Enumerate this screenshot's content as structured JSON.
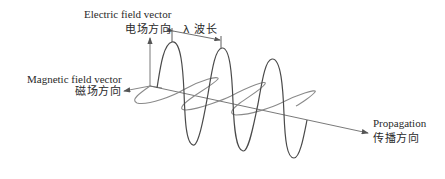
{
  "labels": {
    "electric_en": "Electric field vector",
    "electric_zh": "电场方向",
    "wavelength": "λ 波长",
    "magnetic_en": "Magnetic field vector",
    "magnetic_zh": "磁场方向",
    "propagation_en": "Propagation",
    "propagation_zh": "传播方向"
  },
  "colors": {
    "electric_wave": "#4a4a4a",
    "magnetic_wave": "#8a8a8a",
    "axis": "#6a6a6a",
    "text": "#2a2a2a"
  }
}
